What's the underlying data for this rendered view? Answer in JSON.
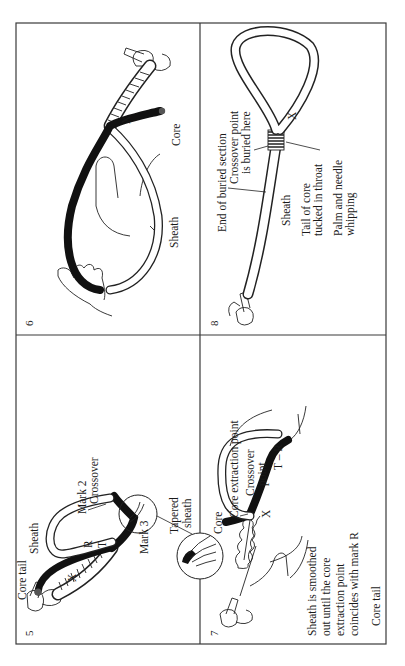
{
  "figure": {
    "orientation": "rotated 90 degrees counter-clockwise",
    "frame_color": "#3a3a3a",
    "ink_color": "#111111",
    "background": "#ffffff"
  },
  "panels": [
    {
      "number": "5",
      "labels": {
        "core_tail": "Core tail",
        "sheath": "Sheath",
        "x": "X",
        "r": "R",
        "t": "T",
        "mark2": "Mark 2",
        "crossover": "Crossover",
        "mark3": "Mark 3",
        "tapered_sheath_line1": "Tapered",
        "tapered_sheath_line2": "sheath"
      }
    },
    {
      "number": "6",
      "labels": {
        "x": "X",
        "sheath": "Sheath",
        "core": "Core"
      }
    },
    {
      "number": "7",
      "labels": {
        "core": "Core",
        "core_extraction_point": "Core extraction point",
        "crossover_point_line1": "Crossover",
        "crossover_point_line2": "point",
        "t_r": "T – R",
        "x": "X",
        "caption_line1": "Sheath is smoothed",
        "caption_line2": "out until the core",
        "caption_line3": "extraction point",
        "caption_line4": "coincides with mark R"
      }
    },
    {
      "number": "8",
      "labels": {
        "end_of_buried_section": "End of buried section",
        "crossover_buried_line1": "Crossover point",
        "crossover_buried_line2": "is buried here",
        "x": "X",
        "sheath": "Sheath",
        "tail_line1": "Tail of core",
        "tail_line2": "tucked in throat",
        "whipping_line1": "Palm and needle",
        "whipping_line2": "whipping"
      }
    }
  ]
}
